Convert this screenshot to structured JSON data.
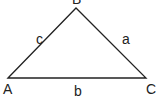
{
  "diagram": {
    "type": "triangle",
    "vertices": [
      {
        "label": "A",
        "x": 8,
        "y": 78
      },
      {
        "label": "B",
        "x": 76,
        "y": 8
      },
      {
        "label": "C",
        "x": 146,
        "y": 78
      }
    ],
    "sides": [
      {
        "label": "a",
        "between": "B-C"
      },
      {
        "label": "b",
        "between": "A-C"
      },
      {
        "label": "c",
        "between": "A-B"
      }
    ],
    "line_color": "#222222"
  }
}
